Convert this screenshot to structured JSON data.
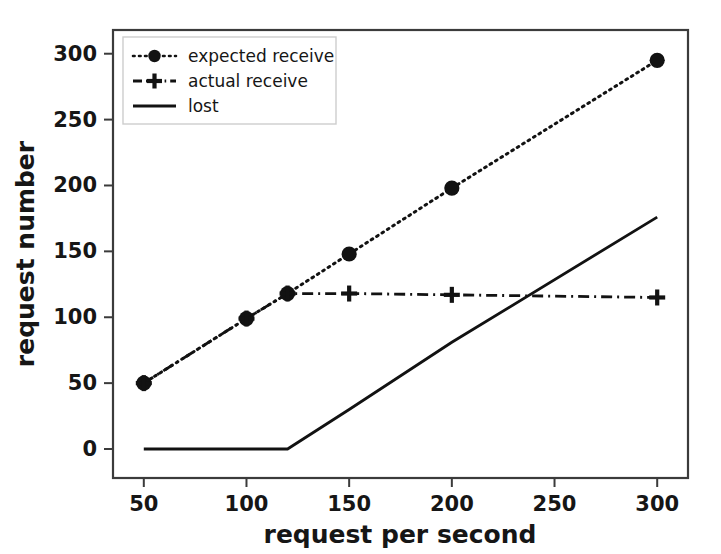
{
  "chart_data": {
    "type": "line",
    "title": "",
    "xlabel": "request per second",
    "ylabel": "request number",
    "xlim": [
      35,
      315
    ],
    "ylim": [
      -22,
      318
    ],
    "xticks": [
      50,
      100,
      150,
      200,
      250,
      300
    ],
    "yticks": [
      0,
      50,
      100,
      150,
      200,
      250,
      300
    ],
    "xtick_labels": [
      "50",
      "100",
      "150",
      "200",
      "250",
      "300"
    ],
    "ytick_labels": [
      "0",
      "50",
      "100",
      "150",
      "200",
      "250",
      "300"
    ],
    "grid": false,
    "legend_position": "upper left",
    "series": [
      {
        "name": "expected receive",
        "linestyle": "dotted",
        "marker": "circle",
        "x": [
          50,
          100,
          120,
          150,
          200,
          300
        ],
        "values": [
          50,
          99,
          118,
          148,
          198,
          295
        ]
      },
      {
        "name": "actual receive",
        "linestyle": "dash-dot",
        "marker": "plus",
        "x": [
          50,
          100,
          120,
          150,
          200,
          300
        ],
        "values": [
          50,
          99,
          118,
          118,
          117,
          115
        ]
      },
      {
        "name": "lost",
        "linestyle": "solid",
        "marker": "none",
        "x": [
          50,
          100,
          120,
          150,
          200,
          300
        ],
        "values": [
          0,
          0,
          0,
          30,
          81,
          176
        ]
      }
    ]
  },
  "legend": {
    "items": [
      {
        "label": "expected receive"
      },
      {
        "label": "actual receive"
      },
      {
        "label": "lost"
      }
    ]
  },
  "colors": {
    "line": "#121212",
    "frame": "#3b3b3b",
    "text": "#161616",
    "background": "#ffffff"
  }
}
